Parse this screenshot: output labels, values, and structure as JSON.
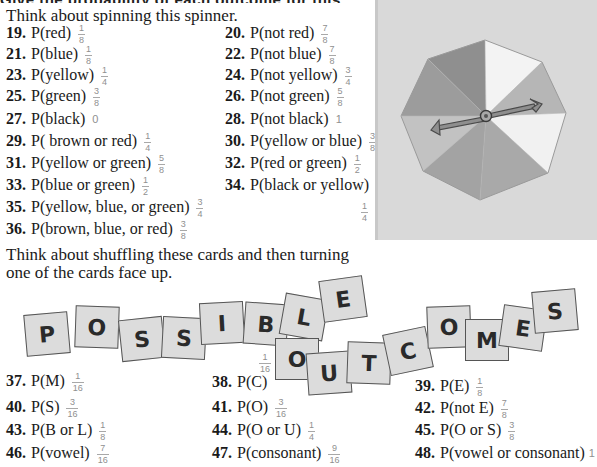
{
  "header": {
    "cut_heading": "Give the probability of each outcome for this spinner."
  },
  "spinner_section": {
    "intro": "Think about spinning this spinner.",
    "exercises": [
      {
        "num": "19.",
        "expr": "P(red)",
        "ans_n": "1",
        "ans_d": "8"
      },
      {
        "num": "20.",
        "expr": "P(not red)",
        "ans_n": "7",
        "ans_d": "8"
      },
      {
        "num": "21.",
        "expr": "P(blue)",
        "ans_n": "1",
        "ans_d": "8"
      },
      {
        "num": "22.",
        "expr": "P(not blue)",
        "ans_n": "7",
        "ans_d": "8"
      },
      {
        "num": "23.",
        "expr": "P(yellow)",
        "ans_n": "1",
        "ans_d": "4"
      },
      {
        "num": "24.",
        "expr": "P(not yellow)",
        "ans_n": "3",
        "ans_d": "4"
      },
      {
        "num": "25.",
        "expr": "P(green)",
        "ans_n": "3",
        "ans_d": "8"
      },
      {
        "num": "26.",
        "expr": "P(not green)",
        "ans_n": "5",
        "ans_d": "8"
      },
      {
        "num": "27.",
        "expr": "P(black)",
        "ans_whole": "0"
      },
      {
        "num": "28.",
        "expr": "P(not black)",
        "ans_whole": "1"
      },
      {
        "num": "29.",
        "expr": "P( brown or red)",
        "ans_n": "1",
        "ans_d": "4"
      },
      {
        "num": "30.",
        "expr": "P(yellow or blue)",
        "ans_n": "3",
        "ans_d": "8"
      },
      {
        "num": "31.",
        "expr": "P(yellow or green)",
        "ans_n": "5",
        "ans_d": "8"
      },
      {
        "num": "32.",
        "expr": "P(red or green)",
        "ans_n": "1",
        "ans_d": "2"
      },
      {
        "num": "33.",
        "expr": "P(blue or green)",
        "ans_n": "1",
        "ans_d": "2"
      },
      {
        "num": "34.",
        "expr": "P(black or yellow)",
        "ans_n": "1",
        "ans_d": "4"
      },
      {
        "num": "35.",
        "expr": "P(yellow, blue, or green)",
        "ans_n": "3",
        "ans_d": "4"
      },
      {
        "num": "36.",
        "expr": "P(brown, blue, or red)",
        "ans_n": "3",
        "ans_d": "8"
      }
    ],
    "spinner": {
      "sections": 8,
      "colors": [
        "#9a9a9a",
        "#8c8c8c",
        "#f4f4f4",
        "#b8b8b8",
        "#f2f2f2",
        "#b0b0b0",
        "#a4a4a4",
        "#c4c4c4"
      ],
      "background": "#d9d9d9"
    }
  },
  "cards_section": {
    "intro_line1": "Think about shuffling these cards and then turning",
    "intro_line2": "one of the cards face up.",
    "cards": [
      {
        "letter": "P",
        "x": 25,
        "y": 313,
        "rot": -5
      },
      {
        "letter": "O",
        "x": 75,
        "y": 306,
        "rot": 2
      },
      {
        "letter": "S",
        "x": 120,
        "y": 318,
        "rot": -6
      },
      {
        "letter": "S",
        "x": 162,
        "y": 317,
        "rot": 3
      },
      {
        "letter": "I",
        "x": 200,
        "y": 302,
        "rot": -3
      },
      {
        "letter": "B",
        "x": 244,
        "y": 303,
        "rot": 4
      },
      {
        "letter": "L",
        "x": 282,
        "y": 296,
        "rot": 10
      },
      {
        "letter": "E",
        "x": 321,
        "y": 278,
        "rot": -8
      },
      {
        "letter": "O",
        "x": 275,
        "y": 338,
        "rot": 0
      },
      {
        "letter": "U",
        "x": 307,
        "y": 352,
        "rot": -4
      },
      {
        "letter": "T",
        "x": 347,
        "y": 342,
        "rot": 2
      },
      {
        "letter": "C",
        "x": 386,
        "y": 330,
        "rot": -12
      },
      {
        "letter": "O",
        "x": 427,
        "y": 306,
        "rot": -2
      },
      {
        "letter": "M",
        "x": 465,
        "y": 319,
        "rot": 0
      },
      {
        "letter": "E",
        "x": 501,
        "y": 307,
        "rot": 8
      },
      {
        "letter": "S",
        "x": 533,
        "y": 290,
        "rot": -5
      }
    ],
    "exercises": [
      {
        "num": "37.",
        "expr": "P(M)",
        "ans_n": "1",
        "ans_d": "16"
      },
      {
        "num": "38.",
        "expr": "P(C)",
        "ans_n": "1",
        "ans_d": "16"
      },
      {
        "num": "39.",
        "expr": "P(E)",
        "ans_n": "1",
        "ans_d": "8"
      },
      {
        "num": "40.",
        "expr": "P(S)",
        "ans_n": "3",
        "ans_d": "16"
      },
      {
        "num": "41.",
        "expr": "P(O)",
        "ans_n": "3",
        "ans_d": "16"
      },
      {
        "num": "42.",
        "expr": "P(not E)",
        "ans_n": "7",
        "ans_d": "8"
      },
      {
        "num": "43.",
        "expr": "P(B or L)",
        "ans_n": "1",
        "ans_d": "8"
      },
      {
        "num": "44.",
        "expr": "P(O or U)",
        "ans_n": "1",
        "ans_d": "4"
      },
      {
        "num": "45.",
        "expr": "P(O or S)",
        "ans_n": "3",
        "ans_d": "8"
      },
      {
        "num": "46.",
        "expr": "P(vowel)",
        "ans_n": "7",
        "ans_d": "16"
      },
      {
        "num": "47.",
        "expr": "P(consonant)",
        "ans_n": "9",
        "ans_d": "16"
      },
      {
        "num": "48.",
        "expr": "P(vowel or consonant)",
        "ans_whole": "1"
      }
    ]
  }
}
